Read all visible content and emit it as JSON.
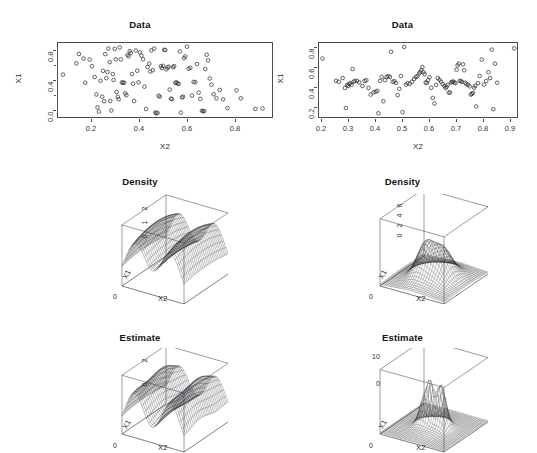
{
  "header": {
    "running_title": "",
    "page_number": ""
  },
  "panels": [
    {
      "id": "data-left",
      "title": "Data",
      "type": "scatter",
      "xlabel": "X2",
      "ylabel": "X1",
      "xticks": [
        "0.2",
        "0.4",
        "0.6",
        "0.8"
      ],
      "yticks": [
        "0.8",
        "0.4",
        "0.0"
      ]
    },
    {
      "id": "data-right",
      "title": "Data",
      "type": "scatter",
      "xlabel": "X2",
      "ylabel": "X1",
      "xticks": [
        "0.2",
        "0.3",
        "0.4",
        "0.5",
        "0.6",
        "0.7",
        "0.8",
        "0.9"
      ],
      "yticks": [
        "0.8",
        "0.6",
        "0.4",
        "0.2"
      ]
    },
    {
      "id": "density-left",
      "title": "Density",
      "type": "surface3d",
      "xlabel": "X2",
      "ylabel": "X1",
      "zticks": [
        "2",
        "1",
        "0"
      ],
      "zero_label": "0"
    },
    {
      "id": "density-right",
      "title": "Density",
      "type": "surface3d",
      "xlabel": "X2",
      "ylabel": "X1",
      "zticks": [
        "6",
        "4",
        "2",
        "0"
      ],
      "zero_label": "0"
    },
    {
      "id": "estimate-left",
      "title": "Estimate",
      "type": "surface3d",
      "xlabel": "X2",
      "ylabel": "X1",
      "zticks": [
        "2",
        "0"
      ],
      "zero_label": "0"
    },
    {
      "id": "estimate-right",
      "title": "Estimate",
      "type": "surface3d",
      "xlabel": "X2",
      "ylabel": "X1",
      "zticks": [
        "10",
        "0"
      ],
      "zero_label": "0"
    }
  ],
  "chart_data": [
    {
      "type": "scatter",
      "title": "Data",
      "xlabel": "X2",
      "ylabel": "X1",
      "xlim": [
        0.13,
        0.9
      ],
      "ylim": [
        -0.02,
        0.98
      ],
      "grid": false,
      "marker": "open-circle",
      "points": [
        [
          0.148,
          0.553
        ],
        [
          0.196,
          0.705
        ],
        [
          0.205,
          0.832
        ],
        [
          0.222,
          0.77
        ],
        [
          0.228,
          0.444
        ],
        [
          0.244,
          0.756
        ],
        [
          0.252,
          0.666
        ],
        [
          0.262,
          0.52
        ],
        [
          0.268,
          0.285
        ],
        [
          0.272,
          0.11
        ],
        [
          0.277,
          0.052
        ],
        [
          0.283,
          0.47
        ],
        [
          0.289,
          0.255
        ],
        [
          0.292,
          0.604
        ],
        [
          0.296,
          0.193
        ],
        [
          0.3,
          0.83
        ],
        [
          0.304,
          0.505
        ],
        [
          0.308,
          0.588
        ],
        [
          0.311,
          0.905
        ],
        [
          0.316,
          0.722
        ],
        [
          0.318,
          0.196
        ],
        [
          0.322,
          0.068
        ],
        [
          0.327,
          0.56
        ],
        [
          0.33,
          0.48
        ],
        [
          0.334,
          0.9
        ],
        [
          0.338,
          0.76
        ],
        [
          0.341,
          0.318
        ],
        [
          0.345,
          0.253
        ],
        [
          0.348,
          0.22
        ],
        [
          0.352,
          0.92
        ],
        [
          0.356,
          0.758
        ],
        [
          0.36,
          0.448
        ],
        [
          0.364,
          0.44
        ],
        [
          0.368,
          0.445
        ],
        [
          0.372,
          0.3
        ],
        [
          0.376,
          0.275
        ],
        [
          0.38,
          0.818
        ],
        [
          0.384,
          0.8
        ],
        [
          0.388,
          0.87
        ],
        [
          0.392,
          0.845
        ],
        [
          0.396,
          0.56
        ],
        [
          0.4,
          0.43
        ],
        [
          0.404,
          0.196
        ],
        [
          0.41,
          0.878
        ],
        [
          0.415,
          0.605
        ],
        [
          0.42,
          0.448
        ],
        [
          0.425,
          0.852
        ],
        [
          0.43,
          0.81
        ],
        [
          0.436,
          0.76
        ],
        [
          0.441,
          0.39
        ],
        [
          0.447,
          0.09
        ],
        [
          0.452,
          0.655
        ],
        [
          0.458,
          0.7
        ],
        [
          0.462,
          0.595
        ],
        [
          0.466,
          0.88
        ],
        [
          0.471,
          0.612
        ],
        [
          0.476,
          0.905
        ],
        [
          0.48,
          0.04
        ],
        [
          0.484,
          0.03
        ],
        [
          0.488,
          0.035
        ],
        [
          0.492,
          0.268
        ],
        [
          0.496,
          0.255
        ],
        [
          0.5,
          0.665
        ],
        [
          0.504,
          0.64
        ],
        [
          0.508,
          0.672
        ],
        [
          0.512,
          0.888
        ],
        [
          0.516,
          0.885
        ],
        [
          0.52,
          0.625
        ],
        [
          0.524,
          0.648
        ],
        [
          0.528,
          0.66
        ],
        [
          0.532,
          0.35
        ],
        [
          0.536,
          0.228
        ],
        [
          0.54,
          0.222
        ],
        [
          0.544,
          0.654
        ],
        [
          0.548,
          0.668
        ],
        [
          0.552,
          0.44
        ],
        [
          0.556,
          0.45
        ],
        [
          0.56,
          0.435
        ],
        [
          0.564,
          0.428
        ],
        [
          0.568,
          0.865
        ],
        [
          0.572,
          0.04
        ],
        [
          0.576,
          0.245
        ],
        [
          0.58,
          0.255
        ],
        [
          0.584,
          0.775
        ],
        [
          0.588,
          0.8
        ],
        [
          0.594,
          0.93
        ],
        [
          0.6,
          0.632
        ],
        [
          0.606,
          0.645
        ],
        [
          0.612,
          0.27
        ],
        [
          0.618,
          0.455
        ],
        [
          0.624,
          0.45
        ],
        [
          0.63,
          0.695
        ],
        [
          0.636,
          0.31
        ],
        [
          0.642,
          0.225
        ],
        [
          0.648,
          0.065
        ],
        [
          0.652,
          0.058
        ],
        [
          0.656,
          0.06
        ],
        [
          0.66,
          0.63
        ],
        [
          0.665,
          0.822
        ],
        [
          0.67,
          0.745
        ],
        [
          0.676,
          0.5
        ],
        [
          0.682,
          0.418
        ],
        [
          0.69,
          0.288
        ],
        [
          0.7,
          0.232
        ],
        [
          0.712,
          0.345
        ],
        [
          0.724,
          0.218
        ],
        [
          0.74,
          0.1
        ],
        [
          0.772,
          0.34
        ],
        [
          0.788,
          0.232
        ],
        [
          0.84,
          0.09
        ],
        [
          0.866,
          0.095
        ]
      ]
    },
    {
      "type": "scatter",
      "title": "Data",
      "xlabel": "X2",
      "ylabel": "X1",
      "xlim": [
        0.19,
        0.91
      ],
      "ylim": [
        0.1,
        0.86
      ],
      "grid": false,
      "marker": "open-circle",
      "points": [
        [
          0.203,
          0.7
        ],
        [
          0.252,
          0.472
        ],
        [
          0.262,
          0.462
        ],
        [
          0.276,
          0.5
        ],
        [
          0.284,
          0.398
        ],
        [
          0.288,
          0.192
        ],
        [
          0.292,
          0.43
        ],
        [
          0.296,
          0.418
        ],
        [
          0.3,
          0.44
        ],
        [
          0.304,
          0.448
        ],
        [
          0.308,
          0.43
        ],
        [
          0.312,
          0.592
        ],
        [
          0.316,
          0.462
        ],
        [
          0.32,
          0.47
        ],
        [
          0.328,
          0.472
        ],
        [
          0.336,
          0.456
        ],
        [
          0.348,
          0.418
        ],
        [
          0.356,
          0.47
        ],
        [
          0.362,
          0.478
        ],
        [
          0.37,
          0.398
        ],
        [
          0.378,
          0.33
        ],
        [
          0.388,
          0.352
        ],
        [
          0.396,
          0.36
        ],
        [
          0.402,
          0.368
        ],
        [
          0.406,
          0.138
        ],
        [
          0.412,
          0.47
        ],
        [
          0.418,
          0.512
        ],
        [
          0.424,
          0.262
        ],
        [
          0.43,
          0.478
        ],
        [
          0.436,
          0.512
        ],
        [
          0.442,
          0.52
        ],
        [
          0.448,
          0.51
        ],
        [
          0.452,
          0.77
        ],
        [
          0.458,
          0.462
        ],
        [
          0.464,
          0.468
        ],
        [
          0.47,
          0.45
        ],
        [
          0.476,
          0.325
        ],
        [
          0.482,
          0.39
        ],
        [
          0.488,
          0.52
        ],
        [
          0.494,
          0.15
        ],
        [
          0.5,
          0.82
        ],
        [
          0.506,
          0.432
        ],
        [
          0.512,
          0.448
        ],
        [
          0.52,
          0.44
        ],
        [
          0.528,
          0.462
        ],
        [
          0.536,
          0.49
        ],
        [
          0.542,
          0.51
        ],
        [
          0.548,
          0.52
        ],
        [
          0.554,
          0.546
        ],
        [
          0.558,
          0.56
        ],
        [
          0.562,
          0.58
        ],
        [
          0.566,
          0.612
        ],
        [
          0.57,
          0.56
        ],
        [
          0.574,
          0.54
        ],
        [
          0.578,
          0.455
        ],
        [
          0.582,
          0.45
        ],
        [
          0.586,
          0.478
        ],
        [
          0.592,
          0.508
        ],
        [
          0.598,
          0.4
        ],
        [
          0.604,
          0.296
        ],
        [
          0.61,
          0.238
        ],
        [
          0.616,
          0.43
        ],
        [
          0.622,
          0.5
        ],
        [
          0.628,
          0.482
        ],
        [
          0.634,
          0.462
        ],
        [
          0.64,
          0.438
        ],
        [
          0.646,
          0.418
        ],
        [
          0.65,
          0.398
        ],
        [
          0.654,
          0.41
        ],
        [
          0.658,
          0.43
        ],
        [
          0.662,
          0.35
        ],
        [
          0.666,
          0.352
        ],
        [
          0.67,
          0.455
        ],
        [
          0.674,
          0.46
        ],
        [
          0.678,
          0.465
        ],
        [
          0.682,
          0.455
        ],
        [
          0.686,
          0.448
        ],
        [
          0.69,
          0.585
        ],
        [
          0.694,
          0.63
        ],
        [
          0.698,
          0.648
        ],
        [
          0.702,
          0.472
        ],
        [
          0.706,
          0.468
        ],
        [
          0.71,
          0.46
        ],
        [
          0.714,
          0.64
        ],
        [
          0.718,
          0.58
        ],
        [
          0.722,
          0.452
        ],
        [
          0.726,
          0.44
        ],
        [
          0.732,
          0.43
        ],
        [
          0.738,
          0.415
        ],
        [
          0.742,
          0.33
        ],
        [
          0.746,
          0.338
        ],
        [
          0.75,
          0.348
        ],
        [
          0.754,
          0.402
        ],
        [
          0.758,
          0.42
        ],
        [
          0.762,
          0.208
        ],
        [
          0.768,
          0.448
        ],
        [
          0.774,
          0.52
        ],
        [
          0.782,
          0.69
        ],
        [
          0.79,
          0.432
        ],
        [
          0.798,
          0.47
        ],
        [
          0.806,
          0.56
        ],
        [
          0.812,
          0.5
        ],
        [
          0.818,
          0.792
        ],
        [
          0.824,
          0.18
        ],
        [
          0.83,
          0.648
        ],
        [
          0.838,
          0.452
        ],
        [
          0.9,
          0.805
        ]
      ]
    },
    {
      "type": "surface3d",
      "title": "Density",
      "xlabel": "X2",
      "ylabel": "X1",
      "zlabel": "",
      "zticks": [
        0,
        1,
        2
      ],
      "zlim": [
        0,
        2.4
      ],
      "description": "true bimodal density surface, two tall ridges separated by a valley"
    },
    {
      "type": "surface3d",
      "title": "Density",
      "xlabel": "X2",
      "ylabel": "X1",
      "zlabel": "",
      "zticks": [
        0,
        2,
        4,
        6
      ],
      "zlim": [
        0,
        6.5
      ],
      "description": "true density surface, low flat plane with two modest central peaks"
    },
    {
      "type": "surface3d",
      "title": "Estimate",
      "xlabel": "X2",
      "ylabel": "X1",
      "zlabel": "",
      "zticks": [
        0,
        2
      ],
      "zlim": [
        0,
        2.4
      ],
      "description": "kernel estimate of bimodal density, two ridges with rougher crests"
    },
    {
      "type": "surface3d",
      "title": "Estimate",
      "xlabel": "X2",
      "ylabel": "X1",
      "zlabel": "",
      "zticks": [
        0,
        10
      ],
      "zlim": [
        0,
        10.5
      ],
      "description": "kernel estimate, flat plane with a few sharp narrow central spikes"
    }
  ]
}
